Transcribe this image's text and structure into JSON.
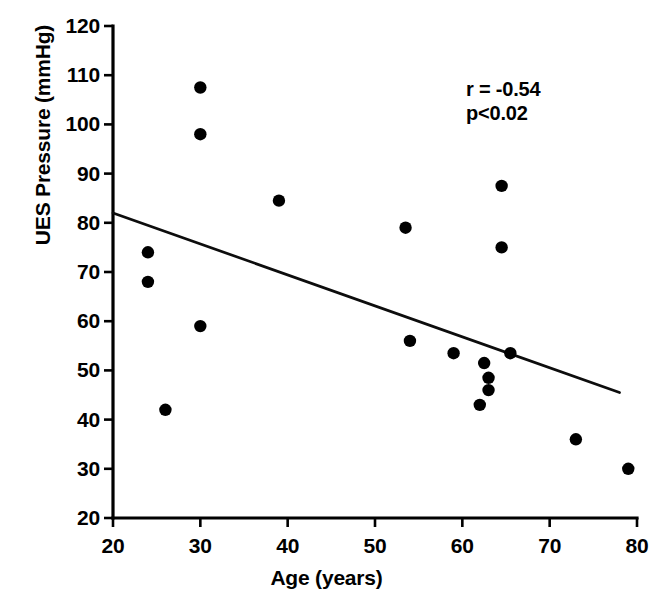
{
  "chart_data": {
    "type": "scatter",
    "title": "",
    "xlabel": "Age (years)",
    "ylabel": "UES Pressure (mmHg)",
    "xlim": [
      20,
      80
    ],
    "ylim": [
      20,
      120
    ],
    "xticks": [
      20,
      30,
      40,
      50,
      60,
      70,
      80
    ],
    "yticks": [
      20,
      30,
      40,
      50,
      60,
      70,
      80,
      90,
      100,
      110,
      120
    ],
    "xtick_labels": [
      "20",
      "30",
      "40",
      "50",
      "60",
      "70",
      "80"
    ],
    "ytick_labels": [
      "20",
      "30",
      "40",
      "50",
      "60",
      "70",
      "80",
      "90",
      "100",
      "110",
      "120"
    ],
    "grid": false,
    "legend": null,
    "marker": "filled-circle",
    "marker_color": "#000000",
    "x": [
      24,
      24,
      26,
      30,
      30,
      30,
      39,
      53.5,
      54,
      59,
      62,
      62.5,
      63,
      63,
      64.5,
      64.5,
      65.5,
      73,
      79
    ],
    "y": [
      74,
      68,
      42,
      107.5,
      98,
      59,
      84.5,
      79,
      56,
      53.5,
      43,
      51.5,
      48.5,
      46,
      75,
      87.5,
      53.5,
      36,
      30
    ],
    "points": [
      {
        "x": 24,
        "y": 74
      },
      {
        "x": 24,
        "y": 68
      },
      {
        "x": 26,
        "y": 42
      },
      {
        "x": 30,
        "y": 107.5
      },
      {
        "x": 30,
        "y": 98
      },
      {
        "x": 30,
        "y": 59
      },
      {
        "x": 39,
        "y": 84.5
      },
      {
        "x": 53.5,
        "y": 79
      },
      {
        "x": 54,
        "y": 56
      },
      {
        "x": 59,
        "y": 53.5
      },
      {
        "x": 62,
        "y": 43
      },
      {
        "x": 62.5,
        "y": 51.5
      },
      {
        "x": 63,
        "y": 48.5
      },
      {
        "x": 63,
        "y": 46
      },
      {
        "x": 64.5,
        "y": 75
      },
      {
        "x": 64.5,
        "y": 87.5
      },
      {
        "x": 65.5,
        "y": 53.5
      },
      {
        "x": 73,
        "y": 36
      },
      {
        "x": 79,
        "y": 30
      }
    ],
    "fit_line": {
      "type": "linear-regression",
      "x_start": 20,
      "y_start": 82,
      "x_end": 78,
      "y_end": 45.5
    },
    "annotations": {
      "correlation": "r = -0.54",
      "pvalue": "p<0.02"
    }
  }
}
